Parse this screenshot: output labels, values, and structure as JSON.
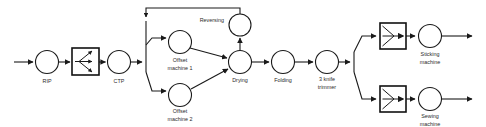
{
  "diagram": {
    "colors": {
      "stroke": "#1a1a1a",
      "background": "#ffffff",
      "label_text": "#2a2a2a"
    },
    "nodes": [
      {
        "id": "rip",
        "label": "RIP",
        "shape": "circle",
        "cx": 47,
        "cy": 62,
        "r": 11.5,
        "label_x": 47,
        "label_y": 82
      },
      {
        "id": "ctp",
        "label": "CTP",
        "shape": "circle",
        "cx": 119,
        "cy": 62,
        "r": 11.5,
        "label_x": 119,
        "label_y": 82
      },
      {
        "id": "offset-machine-1",
        "label": "Offset",
        "label2": "machine 1",
        "shape": "circle",
        "cx": 180,
        "cy": 42,
        "r": 11.5,
        "label_x": 180,
        "label_y": 62
      },
      {
        "id": "offset-machine-2",
        "label": "Offset",
        "label2": "machine 2",
        "shape": "circle",
        "cx": 180,
        "cy": 95,
        "r": 11.5,
        "label_x": 180,
        "label_y": 112
      },
      {
        "id": "drying",
        "label": "Drying",
        "shape": "circle",
        "cx": 240,
        "cy": 62,
        "r": 11.5,
        "label_x": 240,
        "label_y": 81
      },
      {
        "id": "reversing",
        "label": "Reversing",
        "shape": "circle",
        "cx": 240,
        "cy": 25,
        "r": 11.0,
        "label_x": 224,
        "label_y": 21
      },
      {
        "id": "folding",
        "label": "Folding",
        "shape": "circle",
        "cx": 283,
        "cy": 62,
        "r": 11.5,
        "label_x": 283,
        "label_y": 81
      },
      {
        "id": "three-knife-trimmer",
        "label": "3 knife",
        "label2": "trimmer",
        "shape": "circle",
        "cx": 327,
        "cy": 62,
        "r": 11.5,
        "label_x": 327,
        "label_y": 80
      },
      {
        "id": "sticking-machine",
        "label": "Sticking",
        "label2": "machine",
        "shape": "circle",
        "cx": 430,
        "cy": 36,
        "r": 11.5,
        "label_x": 430,
        "label_y": 55
      },
      {
        "id": "sewing-machine",
        "label": "Sewing",
        "label2": "machine",
        "shape": "circle",
        "cx": 430,
        "cy": 99,
        "r": 11.5,
        "label_x": 430,
        "label_y": 117
      }
    ],
    "boxes": [
      {
        "id": "fanout-box",
        "symbol": "fan-out",
        "x": 72,
        "y": 48,
        "w": 27,
        "h": 27
      },
      {
        "id": "fanin-box-sticking",
        "symbol": "fan-in",
        "x": 380,
        "y": 23,
        "w": 26,
        "h": 26
      },
      {
        "id": "fanin-box-sewing",
        "symbol": "fan-in",
        "x": 380,
        "y": 86,
        "w": 26,
        "h": 26
      }
    ],
    "connectors": [
      {
        "id": "input-to-rip",
        "from": "input",
        "to": "rip"
      },
      {
        "id": "rip-to-fanout",
        "from": "rip",
        "to": "fanout-box"
      },
      {
        "id": "fanout-to-ctp",
        "from": "fanout-box",
        "to": "ctp"
      },
      {
        "id": "ctp-to-split",
        "from": "ctp",
        "to": "split-point"
      },
      {
        "id": "split-to-offset-1",
        "from": "split-point",
        "to": "offset-machine-1"
      },
      {
        "id": "split-to-offset-2",
        "from": "split-point",
        "to": "offset-machine-2"
      },
      {
        "id": "offset-1-to-drying",
        "from": "offset-machine-1",
        "to": "drying"
      },
      {
        "id": "offset-2-to-drying",
        "from": "offset-machine-2",
        "to": "drying"
      },
      {
        "id": "drying-to-reversing",
        "from": "drying",
        "to": "reversing"
      },
      {
        "id": "reversing-feedback-to-split",
        "from": "reversing",
        "to": "split-point"
      },
      {
        "id": "drying-to-folding",
        "from": "drying",
        "to": "folding"
      },
      {
        "id": "folding-to-trimmer",
        "from": "folding",
        "to": "three-knife-trimmer"
      },
      {
        "id": "trimmer-to-split-2",
        "from": "three-knife-trimmer",
        "to": "split-point-2"
      },
      {
        "id": "split-2-to-fanin-sticking",
        "from": "split-point-2",
        "to": "fanin-box-sticking"
      },
      {
        "id": "split-2-to-fanin-sewing",
        "from": "split-point-2",
        "to": "fanin-box-sewing"
      },
      {
        "id": "fanin-to-sticking-machine",
        "from": "fanin-box-sticking",
        "to": "sticking-machine"
      },
      {
        "id": "fanin-to-sewing-machine",
        "from": "fanin-box-sewing",
        "to": "sewing-machine"
      },
      {
        "id": "sticking-machine-to-output",
        "from": "sticking-machine",
        "to": "output-1"
      },
      {
        "id": "sewing-machine-to-output",
        "from": "sewing-machine",
        "to": "output-2"
      }
    ]
  }
}
